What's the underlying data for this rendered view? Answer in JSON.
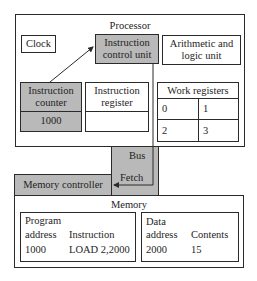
{
  "processor": {
    "title": "Processor",
    "clock": "Clock",
    "control_unit": [
      "Instruction",
      "control unit"
    ],
    "alu": [
      "Arithmetic and",
      "logic unit"
    ],
    "instruction_counter": {
      "label": [
        "Instruction",
        "counter"
      ],
      "value": "1000"
    },
    "instruction_register": {
      "label": [
        "Instruction",
        "register"
      ],
      "value": ""
    },
    "work_registers": {
      "title": "Work registers",
      "cells": [
        "0",
        "1",
        "2",
        "3"
      ]
    }
  },
  "bus": {
    "label": "Bus",
    "fetch": "Fetch"
  },
  "memory_controller": "Memory controller",
  "memory": {
    "title": "Memory",
    "program": {
      "header1": "Program",
      "col1": "address",
      "col2": "Instruction",
      "address": "1000",
      "instruction": "LOAD 2,2000"
    },
    "data": {
      "header1": "Data",
      "col1": "address",
      "col2": "Contents",
      "address": "2000",
      "contents": "15"
    }
  },
  "colors": {
    "fill_grey": "#b9b9b9",
    "line": "#2a2a2a",
    "background": "#ffffff"
  }
}
